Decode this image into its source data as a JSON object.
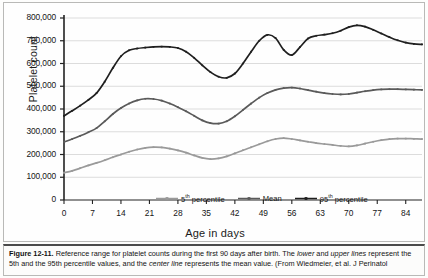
{
  "figure": {
    "caption_label": "Figure 12-11.",
    "caption_body_1": "Reference range for platelet counts during the first 90 days after birth. The ",
    "caption_italic_1": "lower",
    "caption_body_2": " and ",
    "caption_italic_2": "upper lines",
    "caption_body_3": " represent the 5th and the 95th percentile values, and the ",
    "caption_italic_3": "center line",
    "caption_body_4": " represents the mean value. (From Wiedmeier, et al. J Perinatol"
  },
  "chart_data": {
    "type": "line",
    "title": "",
    "xlabel": "Age in days",
    "ylabel": "Platelet count",
    "xlim": [
      0,
      88
    ],
    "ylim": [
      0,
      800000
    ],
    "grid": true,
    "legend_position": "bottom-center",
    "xticks": [
      0,
      7,
      14,
      21,
      28,
      35,
      42,
      49,
      56,
      63,
      70,
      77,
      84
    ],
    "xtick_labels": [
      "0",
      "7",
      "14",
      "21",
      "28",
      "35",
      "42",
      "49",
      "56",
      "63",
      "70",
      "77",
      "84"
    ],
    "yticks": [
      0,
      100000,
      200000,
      300000,
      400000,
      500000,
      600000,
      700000,
      800000
    ],
    "ytick_labels": [
      "0",
      "100,000",
      "200,000",
      "300,000",
      "400,000",
      "500,000",
      "600,000",
      "700,000",
      "800,000"
    ],
    "x": [
      0,
      2,
      4,
      6,
      8,
      10,
      12,
      14,
      16,
      18,
      20,
      22,
      24,
      26,
      28,
      30,
      32,
      34,
      36,
      38,
      40,
      42,
      44,
      46,
      48,
      50,
      52,
      54,
      56,
      58,
      60,
      62,
      64,
      66,
      68,
      70,
      72,
      74,
      76,
      78,
      80,
      82,
      84,
      86,
      88
    ],
    "series": [
      {
        "name": "5th percentile",
        "legend_label": "5th percentile",
        "color": "#9a9a9a",
        "values": [
          120000,
          128000,
          140000,
          152000,
          163000,
          175000,
          188000,
          200000,
          212000,
          222000,
          229000,
          232000,
          231000,
          226000,
          218000,
          208000,
          196000,
          185000,
          180000,
          183000,
          192000,
          205000,
          219000,
          232000,
          245000,
          258000,
          268000,
          272000,
          268000,
          262000,
          256000,
          250000,
          246000,
          242000,
          238000,
          236000,
          240000,
          248000,
          256000,
          263000,
          268000,
          270000,
          270000,
          269000,
          268000
        ]
      },
      {
        "name": "Mean",
        "legend_label": "Mean",
        "color": "#5a5a5a",
        "values": [
          255000,
          268000,
          282000,
          298000,
          316000,
          346000,
          378000,
          404000,
          424000,
          438000,
          445000,
          444000,
          437000,
          424000,
          408000,
          390000,
          370000,
          350000,
          338000,
          336000,
          346000,
          368000,
          396000,
          424000,
          450000,
          470000,
          484000,
          492000,
          494000,
          490000,
          483000,
          476000,
          470000,
          466000,
          464000,
          466000,
          472000,
          478000,
          483000,
          486000,
          487000,
          487000,
          486000,
          485000,
          484000
        ]
      },
      {
        "name": "95th percentile",
        "legend_label": "95th percentile",
        "color": "#1f1f1f",
        "values": [
          370000,
          392000,
          415000,
          440000,
          470000,
          520000,
          580000,
          632000,
          658000,
          666000,
          670000,
          673000,
          674000,
          673000,
          668000,
          652000,
          625000,
          592000,
          562000,
          542000,
          537000,
          556000,
          600000,
          652000,
          700000,
          726000,
          712000,
          660000,
          637000,
          672000,
          710000,
          722000,
          727000,
          733000,
          744000,
          760000,
          768000,
          762000,
          748000,
          732000,
          716000,
          702000,
          692000,
          686000,
          684000
        ]
      }
    ]
  }
}
